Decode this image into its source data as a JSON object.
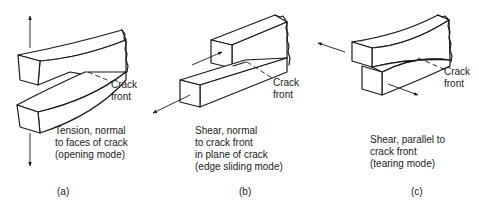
{
  "panels": [
    {
      "id": "a",
      "letter": "(a)",
      "crack_label": [
        "Crack",
        "front"
      ],
      "description": [
        "Tension, normal",
        "to faces of crack",
        "(opening mode)"
      ]
    },
    {
      "id": "b",
      "letter": "(b)",
      "crack_label": [
        "Crack",
        "front"
      ],
      "description": [
        "Shear, normal",
        "to crack front",
        "in plane of crack",
        "(edge sliding mode)"
      ]
    },
    {
      "id": "c",
      "letter": "(c)",
      "crack_label": [
        "Crack",
        "front"
      ],
      "description": [
        "Shear, parallel to",
        "crack front",
        "(tearing mode)"
      ]
    }
  ],
  "colors": {
    "ink": "#1a1a1a",
    "background": "#ffffff"
  }
}
